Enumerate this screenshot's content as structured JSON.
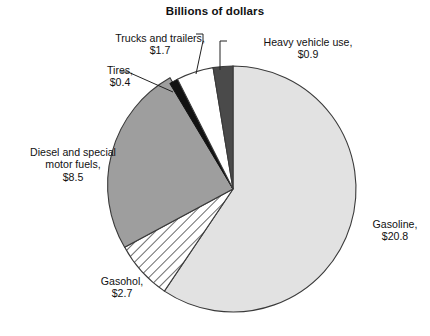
{
  "chart": {
    "title": "Billions of dollars"
  },
  "chart_data": {
    "type": "pie",
    "title": "Billions of dollars",
    "subtitle": "",
    "xlabel": "",
    "ylabel": "",
    "unit": "Billions of dollars",
    "legend_position": "callout-labels",
    "grid": false,
    "total": 35.0,
    "categories": [
      "Gasoline",
      "Diesel and special motor fuels",
      "Gasohol",
      "Trucks and trailers",
      "Heavy vehicle use",
      "Tires"
    ],
    "values": [
      20.8,
      8.5,
      2.7,
      1.7,
      0.9,
      0.4
    ],
    "slices": [
      {
        "name": "Gasoline",
        "label": "Gasoline,\n$20.8",
        "value": 20.8,
        "value_text": "$20.8",
        "fill": "light-gray",
        "color": "#e2e2e2",
        "pattern": "solid",
        "start_angle": 0,
        "sweep_angle": 213.9
      },
      {
        "name": "Gasohol",
        "label": "Gasohol,\n$2.7",
        "value": 2.7,
        "value_text": "$2.7",
        "fill": "diagonal-hatch",
        "color": "#ffffff",
        "pattern": "hatch",
        "start_angle": 213.9,
        "sweep_angle": 27.8
      },
      {
        "name": "Diesel and special motor fuels",
        "label": "Diesel and special\nmotor fuels,\n$8.5",
        "value": 8.5,
        "value_text": "$8.5",
        "fill": "medium-gray",
        "color": "#9e9e9e",
        "pattern": "solid",
        "start_angle": 241.7,
        "sweep_angle": 87.4
      },
      {
        "name": "Tires",
        "label": "Tires,\n$0.4",
        "value": 0.4,
        "value_text": "$0.4",
        "fill": "black",
        "color": "#121212",
        "pattern": "solid",
        "start_angle": 329.1,
        "sweep_angle": 4.1
      },
      {
        "name": "Trucks and trailers",
        "label": "Trucks and trailers,\n$1.7",
        "value": 1.7,
        "value_text": "$1.7",
        "fill": "white",
        "color": "#ffffff",
        "pattern": "solid",
        "start_angle": 333.2,
        "sweep_angle": 17.5
      },
      {
        "name": "Heavy vehicle use",
        "label": "Heavy vehicle use,\n$0.9",
        "value": 0.9,
        "value_text": "$0.9",
        "fill": "dark-gray",
        "color": "#4a4a4a",
        "pattern": "solid",
        "start_angle": 350.7,
        "sweep_angle": 9.3
      }
    ],
    "labels": {
      "gasoline": "Gasoline,\n$20.8",
      "diesel": "Diesel and special\nmotor fuels,\n$8.5",
      "gasohol": "Gasohol,\n$2.7",
      "trucks": "Trucks and trailers,\n$1.7",
      "heavy": "Heavy vehicle use,\n$0.9",
      "tires": "Tires,\n$0.4"
    }
  },
  "colors": {
    "outline": "#333333",
    "text": "#111111",
    "background": "#ffffff",
    "gasoline": "#e2e2e2",
    "diesel": "#9e9e9e",
    "gasohol": "#ffffff",
    "trucks": "#ffffff",
    "heavy": "#4a4a4a",
    "tires": "#121212"
  }
}
